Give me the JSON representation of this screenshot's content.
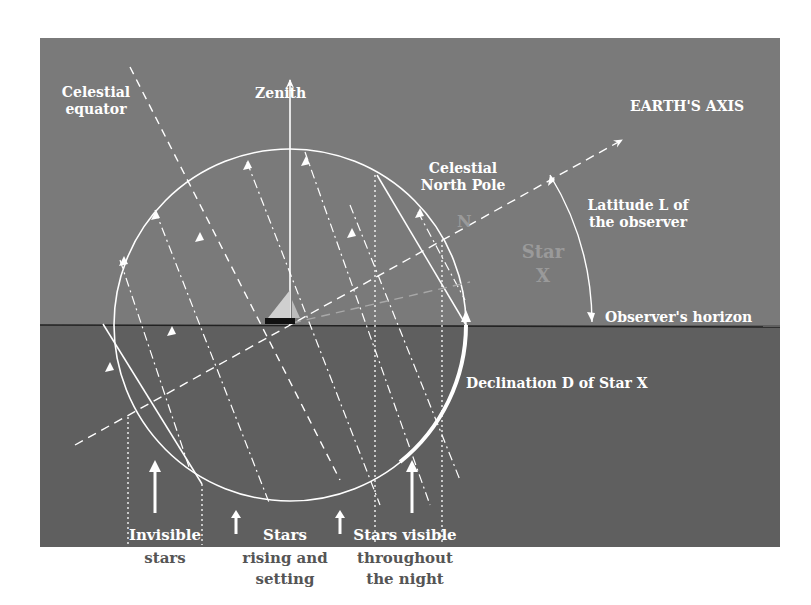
{
  "diagram": {
    "colors": {
      "sky": "#7a7a7a",
      "sea": "#5f5f5f",
      "lines": "#ffffff",
      "caption_text": "#555555"
    },
    "labels": {
      "zenith": "Zenith",
      "celestial_equator_1": "Celestial",
      "celestial_equator_2": "equator",
      "earths_axis": "EARTH'S AXIS",
      "celestial_north_pole_1": "Celestial",
      "celestial_north_pole_2": "North Pole",
      "north_marker": "N",
      "latitude_1": "Latitude L of",
      "latitude_2": "the observer",
      "star_1": "Star",
      "star_2": "X",
      "observers_horizon": "Observer's horizon",
      "declination": "Declination D of Star X"
    },
    "regions": [
      {
        "line1": "Invisible",
        "line2": "stars",
        "line3": ""
      },
      {
        "line1": "Stars",
        "line2": "rising and",
        "line3": "setting"
      },
      {
        "line1": "Stars visible",
        "line2": "throughout",
        "line3": "the night"
      }
    ]
  }
}
